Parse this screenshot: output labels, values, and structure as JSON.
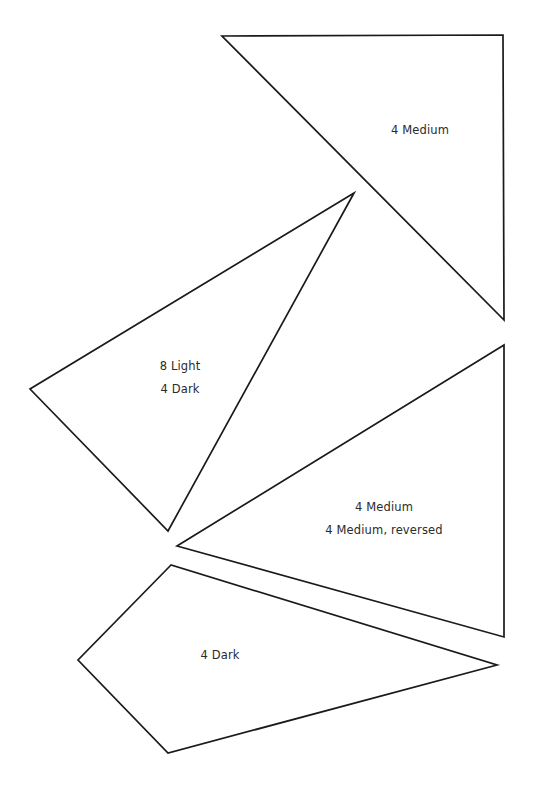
{
  "document": {
    "type": "quilt-pattern-template-sheet",
    "background_color": "#ffffff",
    "ink_color": "#1a1a1a",
    "text_color": "#2b2b2b",
    "width": 534,
    "height": 790
  },
  "pieces": [
    {
      "id": "piece-top-triangle",
      "name": "top-right-triangle",
      "shape": "triangle",
      "points": "222,36 503,35 504,320",
      "label": {
        "x": 420,
        "y": 130,
        "lines": [
          "4  Medium"
        ]
      }
    },
    {
      "id": "piece-left-triangle",
      "name": "left-triangle",
      "shape": "triangle",
      "points": "354,193 30,389 168,531",
      "label": {
        "x": 180,
        "y": 378,
        "lines": [
          "8  Light",
          "4  Dark"
        ]
      }
    },
    {
      "id": "piece-middle-triangle",
      "name": "middle-right-triangle",
      "shape": "triangle",
      "points": "504,345 177,546 504,637",
      "label": {
        "x": 384,
        "y": 519,
        "lines": [
          "4  Medium",
          "4  Medium, reversed"
        ]
      }
    },
    {
      "id": "piece-bottom-kite",
      "name": "bottom-kite",
      "shape": "quadrilateral",
      "points": "171,565 78,660 168,753 497,665",
      "label": {
        "x": 220,
        "y": 655,
        "lines": [
          "4  Dark"
        ]
      }
    }
  ]
}
